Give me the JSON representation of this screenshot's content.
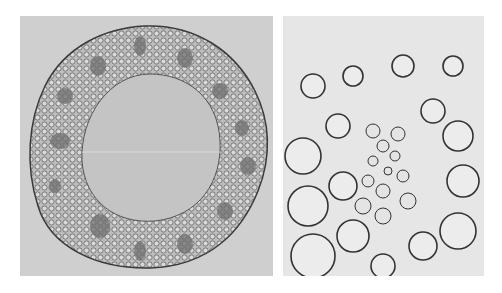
{
  "figure": {
    "panels": [
      {
        "id": "left",
        "subject": "stem-cross-section-whole",
        "description": "Ring of tissue with vascular bundles around a hollow central pith cavity"
      },
      {
        "id": "right",
        "subject": "vascular-bundle-magnified",
        "description": "Magnified view of a vascular bundle surrounded by parenchyma cells"
      }
    ],
    "colors": {
      "background": "#ffffff",
      "left_panel_bg": "#cfcfcf",
      "cavity": "#c4c4c4",
      "tissue": "#a9a9a9",
      "cell_wall": "#3a3a3a",
      "right_panel_bg": "#e6e6e6"
    }
  }
}
